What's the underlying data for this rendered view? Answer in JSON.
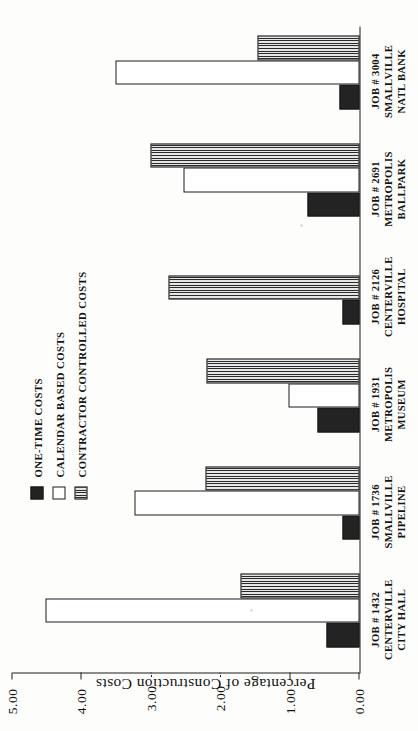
{
  "chart_data": {
    "type": "bar",
    "orientation": "vertical",
    "title": "",
    "subtitle": "",
    "xlabel": "",
    "ylabel": "Percentage of Construction Costs",
    "ylim": [
      0.0,
      5.0
    ],
    "ytick_labels": [
      "0.00",
      "1.00",
      "2.00",
      "3.00",
      "4.00",
      "5.00"
    ],
    "ytick_values": [
      0,
      1,
      2,
      3,
      4,
      5
    ],
    "grid": false,
    "legend_position": "upper-left-inside",
    "categories": [
      "JOB # 1432 CENTERVILLE CITY HALL",
      "JOB # 1736 SMALLVILLE PIPELINE",
      "JOB # 1931 METROPOLIS MUSEUM",
      "JOB # 2126 CENTERVILLE HOSPITAL",
      "JOB # 2691 METROPOLIS BALLPARK",
      "JOB # 3004 SMALLVILLE NATL BANK"
    ],
    "category_lines": [
      [
        "JOB # 1432",
        "CENTERVILLE",
        "CITY HALL"
      ],
      [
        "JOB # 1736",
        "SMALLVILLE",
        "PIPELINE"
      ],
      [
        "JOB # 1931",
        "METROPOLIS",
        "MUSEUM"
      ],
      [
        "JOB # 2126",
        "CENTERVILLE",
        "HOSPITAL"
      ],
      [
        "JOB # 2691",
        "METROPOLIS",
        "BALLPARK"
      ],
      [
        "JOB # 3004",
        "SMALLVILLE",
        "NATL BANK"
      ]
    ],
    "series": [
      {
        "name": "ONE-TIME COSTS",
        "fill": "solid-black",
        "values": [
          0.48,
          0.24,
          0.6,
          0.25,
          0.75,
          0.29
        ]
      },
      {
        "name": "CALENDAR BASED COSTS",
        "fill": "open-white",
        "values": [
          4.53,
          3.24,
          1.03,
          0.0,
          2.53,
          3.51
        ]
      },
      {
        "name": "CONTRACTOR CONTROLLED COSTS",
        "fill": "vertical-hatch",
        "values": [
          1.72,
          2.22,
          2.21,
          2.75,
          3.01,
          1.47
        ]
      }
    ]
  },
  "axis": {
    "value_axis_title": "Percentage of Construction Costs",
    "ticks": [
      "5.00",
      "4.00",
      "3.00",
      "2.00",
      "1.00",
      "0.00"
    ]
  },
  "legend": {
    "items": [
      {
        "label": "ONE-TIME COSTS"
      },
      {
        "label": "CALENDAR BASED COSTS"
      },
      {
        "label": "CONTRACTOR CONTROLLED COSTS"
      }
    ]
  },
  "colors": {
    "one_time": "#232323",
    "calendar_based": "#ffffff",
    "contractor_controlled": "#b9b9b9",
    "axis": "#1c1c1c",
    "background": "#fdfdfc"
  }
}
